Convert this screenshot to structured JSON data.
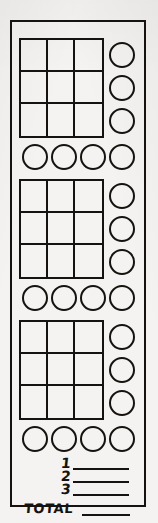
{
  "sheet": {
    "kind": "hand-drawn score card",
    "ink_color": "#15120f",
    "paper_color": "#f4f3f1",
    "blocks": [
      {
        "index": "1",
        "grid": {
          "rows": 3,
          "columns": 3,
          "cells": [
            "",
            "",
            "",
            "",
            "",
            "",
            "",
            "",
            ""
          ]
        },
        "side_circles": [
          "",
          "",
          ""
        ],
        "bottom_circles": [
          "",
          "",
          "",
          ""
        ]
      },
      {
        "index": "2",
        "grid": {
          "rows": 3,
          "columns": 3,
          "cells": [
            "",
            "",
            "",
            "",
            "",
            "",
            "",
            "",
            ""
          ]
        },
        "side_circles": [
          "",
          "",
          ""
        ],
        "bottom_circles": [
          "",
          "",
          "",
          ""
        ]
      },
      {
        "index": "3",
        "grid": {
          "rows": 3,
          "columns": 3,
          "cells": [
            "",
            "",
            "",
            "",
            "",
            "",
            "",
            "",
            ""
          ]
        },
        "side_circles": [
          "",
          "",
          ""
        ],
        "bottom_circles": [
          "",
          "",
          "",
          ""
        ]
      }
    ],
    "tally": {
      "rows": [
        {
          "label": "1",
          "value": ""
        },
        {
          "label": "2",
          "value": ""
        },
        {
          "label": "3",
          "value": ""
        }
      ],
      "total_label": "TOTAL",
      "total_value": ""
    }
  }
}
